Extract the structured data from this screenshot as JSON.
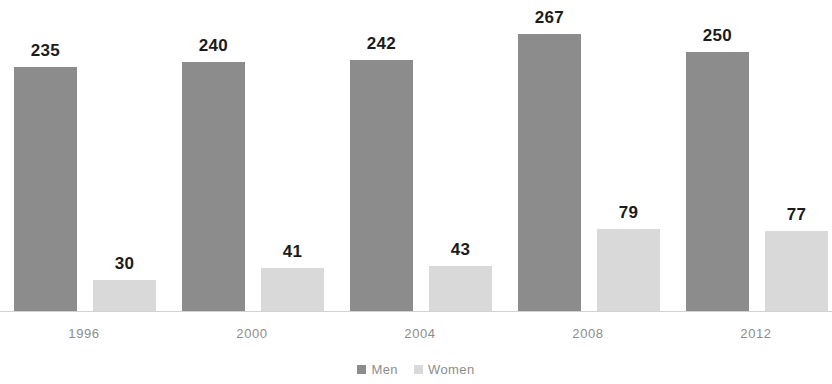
{
  "chart_data": {
    "type": "bar",
    "title": "",
    "subtitle": "",
    "xlabel": "",
    "ylabel": "",
    "categories": [
      "1996",
      "2000",
      "2004",
      "2008",
      "2012"
    ],
    "series": [
      {
        "name": "Men",
        "color": "#8c8c8c",
        "values": [
          235,
          240,
          242,
          267,
          250
        ]
      },
      {
        "name": "Women",
        "color": "#d9d9d9",
        "values": [
          30,
          41,
          43,
          79,
          77
        ]
      }
    ],
    "ylim": [
      0,
      280
    ],
    "grid": false,
    "axis_visible": true,
    "data_labels": true,
    "legend": {
      "position": "bottom",
      "entries": [
        {
          "label": "Men",
          "marker": "square-dark",
          "color": "#8c8c8c"
        },
        {
          "label": "Women",
          "marker": "square-light",
          "color": "#d9d9d9"
        }
      ]
    }
  }
}
